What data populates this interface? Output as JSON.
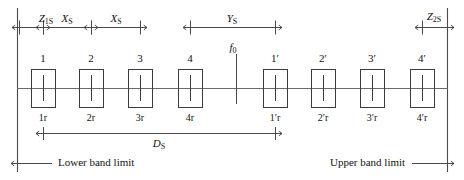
{
  "diagram": {
    "colors": {
      "line": "#4a4a4a",
      "box_stroke": "#3c3c3c",
      "text": "#111111",
      "background": "#ffffff"
    },
    "band_limits": {
      "lower_label": "Lower band limit",
      "upper_label": "Upper band limit"
    },
    "center_frequency": {
      "label": "f",
      "subscript": "0"
    },
    "dimensions": [
      {
        "id": "z1s",
        "symbol": "Z",
        "subscript": "1S",
        "x_center": 46,
        "x_start": 19,
        "x_end": 43
      },
      {
        "id": "xs_a",
        "symbol": "X",
        "subscript": "S",
        "x_center": 67,
        "x_start": 43,
        "x_end": 91
      },
      {
        "id": "xs_b",
        "symbol": "X",
        "subscript": "S",
        "x_center": 116,
        "x_start": 91,
        "x_end": 140
      },
      {
        "id": "ys",
        "symbol": "Y",
        "subscript": "S",
        "x_center": 232,
        "x_start": 190,
        "x_end": 275
      },
      {
        "id": "z2s",
        "symbol": "Z",
        "subscript": "2S",
        "x_center": 434,
        "x_start": 422,
        "x_end": 447
      },
      {
        "id": "ds",
        "symbol": "D",
        "subscript": "S",
        "x_center": 159,
        "x_start": 43,
        "x_end": 275
      }
    ],
    "channels": [
      {
        "id": "ch1",
        "top_label": "1",
        "bottom_label": "1r",
        "x_center": 43,
        "group": "lower"
      },
      {
        "id": "ch2",
        "top_label": "2",
        "bottom_label": "2r",
        "x_center": 91,
        "group": "lower"
      },
      {
        "id": "ch3",
        "top_label": "3",
        "bottom_label": "3r",
        "x_center": 140,
        "group": "lower"
      },
      {
        "id": "ch4",
        "top_label": "4",
        "bottom_label": "4r",
        "x_center": 190,
        "group": "lower"
      },
      {
        "id": "ch1p",
        "top_label": "1′",
        "bottom_label": "1′r",
        "x_center": 275,
        "group": "upper"
      },
      {
        "id": "ch2p",
        "top_label": "2′",
        "bottom_label": "2′r",
        "x_center": 323,
        "group": "upper"
      },
      {
        "id": "ch3p",
        "top_label": "3′",
        "bottom_label": "3′r",
        "x_center": 372,
        "group": "upper"
      },
      {
        "id": "ch4p",
        "top_label": "4′",
        "bottom_label": "4′r",
        "x_center": 422,
        "group": "upper"
      }
    ],
    "geometry": {
      "box_width": 24,
      "box_height": 38,
      "box_top": 69,
      "baseline_y": 88,
      "left_limit_x": 17,
      "right_limit_x": 448,
      "limit_top_y": 8,
      "limit_bottom_y": 172
    }
  }
}
